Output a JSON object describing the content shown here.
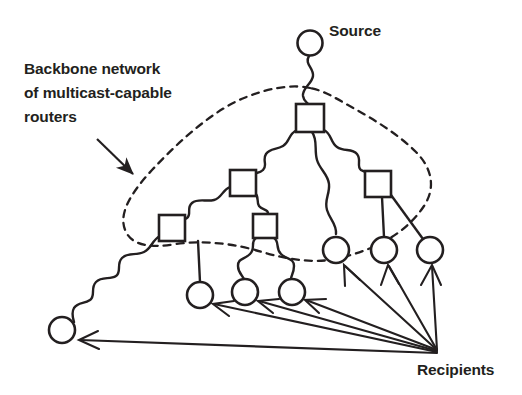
{
  "diagram": {
    "type": "network-diagram",
    "ink_color": "#231f20",
    "background_color": "#ffffff",
    "labels": {
      "backbone": "Backbone network\nof multicast-capable\nrouters",
      "backbone_line1": "Backbone network",
      "backbone_line2": "of multicast-capable",
      "backbone_line3": "routers",
      "source": "Source",
      "recipients": "Recipients"
    },
    "legend_arrows": [
      {
        "name": "backbone-callout-arrow",
        "from": [
          98,
          140
        ],
        "to": [
          137,
          178
        ],
        "style": "solid-filled-head"
      },
      {
        "name": "recipient-pointer-1",
        "from": [
          438,
          354
        ],
        "to": [
          78,
          340
        ],
        "style": "solid-open-head"
      },
      {
        "name": "recipient-pointer-2",
        "from": [
          438,
          354
        ],
        "to": [
          213,
          303
        ],
        "style": "solid-open-head"
      },
      {
        "name": "recipient-pointer-3",
        "from": [
          438,
          354
        ],
        "to": [
          258,
          300
        ],
        "style": "solid-open-head"
      },
      {
        "name": "recipient-pointer-4",
        "from": [
          438,
          354
        ],
        "to": [
          305,
          298
        ],
        "style": "solid-open-head"
      },
      {
        "name": "recipient-pointer-5",
        "from": [
          438,
          354
        ],
        "to": [
          345,
          265
        ],
        "style": "solid-open-head"
      },
      {
        "name": "recipient-pointer-6",
        "from": [
          438,
          354
        ],
        "to": [
          388,
          265
        ],
        "style": "solid-open-head"
      },
      {
        "name": "recipient-pointer-7",
        "from": [
          438,
          354
        ],
        "to": [
          432,
          265
        ],
        "style": "solid-open-head"
      }
    ],
    "nodes": {
      "source_host": {
        "name": "source-host-circle",
        "shape": "circle",
        "cx": 310,
        "cy": 43,
        "r": 12.5
      },
      "routers": [
        {
          "name": "router-root",
          "shape": "square",
          "cx": 310,
          "cy": 118,
          "size": 28
        },
        {
          "name": "router-left-mid",
          "shape": "square",
          "cx": 243,
          "cy": 183,
          "size": 26
        },
        {
          "name": "router-right",
          "shape": "square",
          "cx": 378,
          "cy": 184,
          "size": 26
        },
        {
          "name": "router-far-left",
          "shape": "square",
          "cx": 172,
          "cy": 228,
          "size": 26
        },
        {
          "name": "router-lower-mid",
          "shape": "square",
          "cx": 265,
          "cy": 226,
          "size": 24
        }
      ],
      "recipients": [
        {
          "name": "recipient-host-1",
          "shape": "circle",
          "cx": 62,
          "cy": 330,
          "r": 13
        },
        {
          "name": "recipient-host-2",
          "shape": "circle",
          "cx": 200,
          "cy": 295,
          "r": 13
        },
        {
          "name": "recipient-host-3",
          "shape": "circle",
          "cx": 245,
          "cy": 292,
          "r": 13
        },
        {
          "name": "recipient-host-4",
          "shape": "circle",
          "cx": 292,
          "cy": 292,
          "r": 13
        },
        {
          "name": "recipient-host-5",
          "shape": "circle",
          "cx": 336,
          "cy": 250,
          "r": 13
        },
        {
          "name": "recipient-host-6",
          "shape": "circle",
          "cx": 384,
          "cy": 250,
          "r": 13
        },
        {
          "name": "recipient-host-7",
          "shape": "circle",
          "cx": 430,
          "cy": 250,
          "r": 13
        }
      ]
    },
    "links": [
      {
        "name": "link-source-to-root",
        "from": "source_host",
        "to": "router-root",
        "style": "wavy"
      },
      {
        "name": "link-root-to-left-mid",
        "from": "router-root",
        "to": "router-left-mid",
        "style": "wavy"
      },
      {
        "name": "link-root-to-right",
        "from": "router-root",
        "to": "router-right",
        "style": "wavy"
      },
      {
        "name": "link-root-to-host5",
        "from": "router-root",
        "to": "recipient-host-5",
        "style": "wavy"
      },
      {
        "name": "link-left-mid-to-far-left",
        "from": "router-left-mid",
        "to": "router-far-left",
        "style": "wavy"
      },
      {
        "name": "link-left-mid-to-lower",
        "from": "router-left-mid",
        "to": "router-lower-mid",
        "style": "wavy"
      },
      {
        "name": "link-far-left-to-host1",
        "from": "router-far-left",
        "to": "recipient-host-1",
        "style": "wavy"
      },
      {
        "name": "link-far-left-to-host2",
        "from": "router-far-left",
        "to": "recipient-host-2",
        "style": "straight"
      },
      {
        "name": "link-lower-to-host3",
        "from": "router-lower-mid",
        "to": "recipient-host-3",
        "style": "wavy"
      },
      {
        "name": "link-lower-to-host4",
        "from": "router-lower-mid",
        "to": "recipient-host-4",
        "style": "wavy"
      },
      {
        "name": "link-right-to-host6",
        "from": "router-right",
        "to": "recipient-host-6",
        "style": "straight"
      },
      {
        "name": "link-right-to-host7",
        "from": "router-right",
        "to": "recipient-host-7",
        "style": "straight"
      }
    ],
    "boundary": {
      "name": "backbone-boundary",
      "style": "dashed-closed-curve",
      "encloses": [
        "router-root",
        "router-left-mid",
        "router-right",
        "router-far-left",
        "router-lower-mid"
      ]
    }
  }
}
